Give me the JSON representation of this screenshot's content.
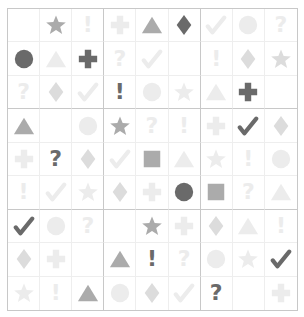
{
  "puzzle": {
    "name": "symbol-sudoku",
    "size": 9,
    "colors": {
      "dark": "#6a6a6a",
      "medium": "#ababab",
      "faint": "#ececec",
      "faint_plus": "#dcdcdc",
      "grid_line": "#eeeeee",
      "block_line": "#c8c8c8"
    },
    "symbols": {
      "star": "star-icon",
      "triangle": "triangle-icon",
      "diamond": "diamond-icon",
      "circle": "circle-icon",
      "plus": "plus-icon",
      "check": "check-icon",
      "question": "question-mark-icon",
      "exclaim": "exclamation-icon",
      "square": "square-icon"
    },
    "grid": [
      [
        null,
        [
          "star",
          "medium"
        ],
        [
          "exclaim",
          "faint"
        ],
        [
          "plus",
          "faint"
        ],
        [
          "triangle",
          "medium"
        ],
        [
          "diamond",
          "dark"
        ],
        [
          "check",
          "faint"
        ],
        [
          "circle",
          "faint"
        ],
        [
          "question",
          "faint"
        ]
      ],
      [
        [
          "circle",
          "dark"
        ],
        [
          "triangle",
          "faint"
        ],
        [
          "plus",
          "dark"
        ],
        [
          "question",
          "faint"
        ],
        [
          "check",
          "faint"
        ],
        null,
        [
          "exclaim",
          "faint"
        ],
        [
          "diamond",
          "faint_plus"
        ],
        [
          "star",
          "faint_plus"
        ]
      ],
      [
        [
          "question",
          "faint"
        ],
        [
          "diamond",
          "faint_plus"
        ],
        [
          "check",
          "faint"
        ],
        [
          "exclaim",
          "dark"
        ],
        [
          "circle",
          "faint"
        ],
        [
          "star",
          "faint"
        ],
        [
          "triangle",
          "faint"
        ],
        [
          "plus",
          "dark"
        ],
        null
      ],
      [
        [
          "triangle",
          "medium"
        ],
        null,
        [
          "circle",
          "faint"
        ],
        [
          "star",
          "medium"
        ],
        [
          "question",
          "faint"
        ],
        [
          "exclaim",
          "faint"
        ],
        [
          "plus",
          "faint"
        ],
        [
          "check",
          "dark"
        ],
        [
          "diamond",
          "faint_plus"
        ]
      ],
      [
        [
          "plus",
          "faint"
        ],
        [
          "question",
          "dark"
        ],
        [
          "diamond",
          "faint_plus"
        ],
        [
          "check",
          "faint"
        ],
        [
          "square",
          "medium"
        ],
        [
          "triangle",
          "faint"
        ],
        [
          "star",
          "faint"
        ],
        [
          "exclaim",
          "faint"
        ],
        [
          "circle",
          "faint"
        ]
      ],
      [
        [
          "exclaim",
          "faint"
        ],
        [
          "check",
          "faint"
        ],
        [
          "star",
          "faint"
        ],
        [
          "diamond",
          "faint_plus"
        ],
        [
          "plus",
          "faint"
        ],
        [
          "circle",
          "dark"
        ],
        [
          "square",
          "medium"
        ],
        [
          "question",
          "faint"
        ],
        [
          "triangle",
          "faint"
        ]
      ],
      [
        [
          "check",
          "dark"
        ],
        [
          "circle",
          "faint"
        ],
        [
          "question",
          "faint"
        ],
        null,
        [
          "star",
          "medium"
        ],
        [
          "plus",
          "faint"
        ],
        [
          "diamond",
          "faint_plus"
        ],
        [
          "triangle",
          "faint"
        ],
        [
          "exclaim",
          "faint"
        ]
      ],
      [
        [
          "diamond",
          "faint_plus"
        ],
        [
          "plus",
          "faint"
        ],
        null,
        [
          "triangle",
          "medium"
        ],
        [
          "exclaim",
          "dark"
        ],
        [
          "question",
          "faint"
        ],
        [
          "circle",
          "faint"
        ],
        [
          "star",
          "faint"
        ],
        [
          "check",
          "dark"
        ]
      ],
      [
        [
          "star",
          "faint"
        ],
        [
          "exclaim",
          "faint"
        ],
        [
          "triangle",
          "medium"
        ],
        [
          "circle",
          "faint"
        ],
        [
          "diamond",
          "faint_plus"
        ],
        [
          "check",
          "faint"
        ],
        [
          "question",
          "dark"
        ],
        null,
        [
          "plus",
          "faint"
        ]
      ]
    ]
  }
}
